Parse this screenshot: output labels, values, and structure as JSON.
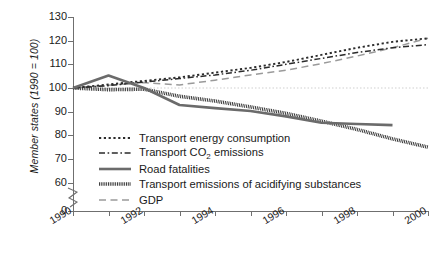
{
  "chart_data": {
    "type": "line",
    "title": "",
    "subtitle": "",
    "xlabel": "",
    "ylabel": "Member states (1990 = 100)",
    "x": [
      1990,
      1991,
      1992,
      1993,
      1994,
      1995,
      1996,
      1997,
      1998,
      1999,
      2000
    ],
    "xlim": [
      1990,
      2000
    ],
    "ylim": [
      60,
      130
    ],
    "y_axis_break": true,
    "y_ticks": [
      "0",
      "60",
      "70",
      "80",
      "90",
      "100",
      "110",
      "120",
      "130"
    ],
    "x_ticks": [
      "1990",
      "",
      "1992",
      "",
      "1994",
      "",
      "1996",
      "",
      "1998",
      "",
      "2000"
    ],
    "x_tick_labels_shown": [
      "1990",
      "1992",
      "1994",
      "1996",
      "1998",
      "2000"
    ],
    "grid": false,
    "reference_line": {
      "value": 100,
      "style": "dotted",
      "color": "#cfcfcf"
    },
    "legend_position": "inside-lower-left",
    "series": [
      {
        "name": "Transport energy consumption",
        "style": "dotted",
        "color": "#2b2b2b",
        "values": [
          100,
          101.5,
          103,
          104.5,
          106.5,
          108.5,
          111,
          114,
          117,
          119.5,
          121
        ]
      },
      {
        "name": "Transport CO2 emissions",
        "label": "Transport CO₂ emissions",
        "style": "dash-dot",
        "color": "#2b2b2b",
        "values": [
          100,
          101,
          102.5,
          104,
          105.5,
          107.5,
          110,
          112.5,
          115,
          117,
          118.3
        ]
      },
      {
        "name": "Road fatalities",
        "style": "solid-thick",
        "color": "#6b6b6b",
        "values": [
          100,
          105.3,
          100,
          92.8,
          91.5,
          90.3,
          88,
          85.3,
          84.8,
          84.3,
          null
        ]
      },
      {
        "name": "Transport emissions of acidifying substances",
        "style": "hatched",
        "color": "#2b2b2b",
        "values": [
          100,
          99.3,
          99.5,
          96.5,
          94.5,
          92,
          89.3,
          86,
          82.5,
          78.5,
          75
        ]
      },
      {
        "name": "GDP",
        "style": "long-dash",
        "color": "#9a9a9a",
        "values": [
          100,
          101.2,
          102.3,
          101.3,
          103.3,
          105.5,
          107.5,
          110.3,
          113.5,
          117,
          121
        ]
      }
    ]
  },
  "axis": {
    "y_title": "Member states (1990 = 100)",
    "y_ticks": [
      {
        "label": "130",
        "value": 130
      },
      {
        "label": "120",
        "value": 120
      },
      {
        "label": "110",
        "value": 110
      },
      {
        "label": "100",
        "value": 100
      },
      {
        "label": "90",
        "value": 90
      },
      {
        "label": "80",
        "value": 80
      },
      {
        "label": "70",
        "value": 70
      },
      {
        "label": "60",
        "value": 60
      },
      {
        "label": "0",
        "value": 0
      }
    ],
    "x_ticks": [
      {
        "label": "1990",
        "value": 1990
      },
      {
        "label": "1992",
        "value": 1992
      },
      {
        "label": "1994",
        "value": 1994
      },
      {
        "label": "1996",
        "value": 1996
      },
      {
        "label": "1998",
        "value": 1998
      },
      {
        "label": "2000",
        "value": 2000
      }
    ]
  },
  "legend": {
    "items": [
      {
        "label": "Transport energy consumption",
        "style": "dotted"
      },
      {
        "label": "Transport CO₂ emissions",
        "style": "dash-dot"
      },
      {
        "label": "Road fatalities",
        "style": "solid-thick"
      },
      {
        "label": "Transport emissions of acidifying substances",
        "style": "hatched"
      },
      {
        "label": "GDP",
        "style": "long-dash"
      }
    ]
  }
}
